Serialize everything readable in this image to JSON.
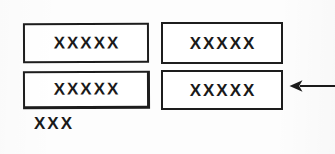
{
  "document": {
    "type": "scanned-redacted-form-fragment",
    "background_color": "#fdfdfd",
    "ink_color": "#1a1a1a"
  },
  "boxes": [
    {
      "id": "top-left",
      "text": "XXXXX",
      "char_count": 5
    },
    {
      "id": "top-right",
      "text": "XXXXX",
      "char_count": 5
    },
    {
      "id": "bottom-left",
      "text": "XXXXX",
      "char_count": 5
    },
    {
      "id": "bottom-right",
      "text": "XXXXX",
      "char_count": 5
    }
  ],
  "caption": {
    "text": "XXX"
  },
  "annotation": {
    "arrow": {
      "icon": "arrow-left-icon",
      "direction": "left",
      "points_at": "bottom-right",
      "color": "#1a1a1a"
    }
  }
}
